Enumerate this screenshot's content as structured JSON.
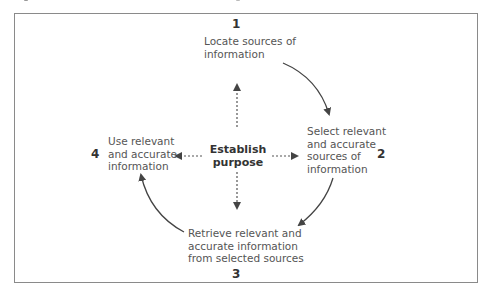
{
  "diagram": {
    "center": {
      "line1": "Establish",
      "line2": "purpose"
    },
    "steps": [
      {
        "number": "1",
        "lines": [
          "Locate sources of",
          "information"
        ]
      },
      {
        "number": "2",
        "lines": [
          "Select relevant",
          "and accurate",
          "sources of",
          "information"
        ]
      },
      {
        "number": "3",
        "lines": [
          "Retrieve relevant and",
          "accurate information",
          "from selected sources"
        ]
      },
      {
        "number": "4",
        "lines": [
          "Use relevant",
          "and accurate",
          "information"
        ]
      }
    ],
    "colors": {
      "border": "#8a8a8a",
      "text": "#555555",
      "arrow": "#444444"
    }
  }
}
